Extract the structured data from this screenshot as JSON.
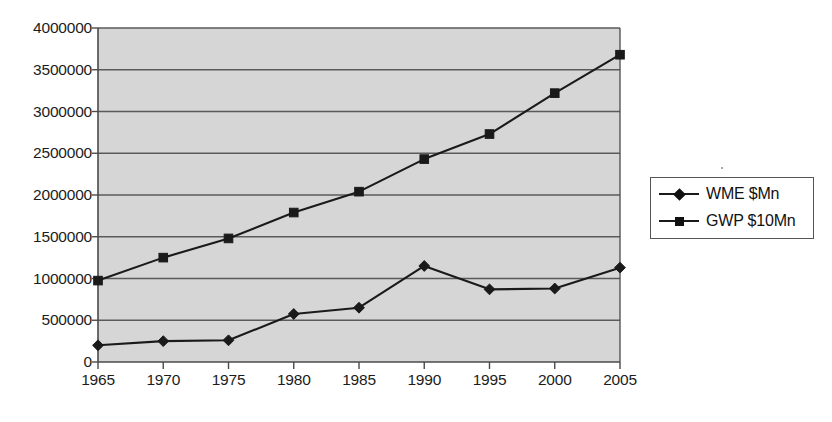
{
  "chart_data": {
    "type": "line",
    "title": "",
    "xlabel": "",
    "ylabel": "",
    "categories": [
      "1965",
      "1970",
      "1975",
      "1980",
      "1985",
      "1990",
      "1995",
      "2000",
      "2005"
    ],
    "x": [
      1965,
      1970,
      1975,
      1980,
      1985,
      1990,
      1995,
      2000,
      2005
    ],
    "series": [
      {
        "name": "WME $Mn",
        "marker": "diamond",
        "color": "#1a1a1a",
        "values": [
          200000,
          250000,
          260000,
          575000,
          650000,
          1150000,
          870000,
          880000,
          1130000
        ]
      },
      {
        "name": "GWP $10Mn",
        "marker": "square",
        "color": "#1a1a1a",
        "values": [
          975000,
          1250000,
          1480000,
          1790000,
          2040000,
          2430000,
          2730000,
          3220000,
          3680000
        ]
      }
    ],
    "ylim": [
      0,
      4000000
    ],
    "ytick_labels": [
      "0",
      "500000",
      "1000000",
      "1500000",
      "2000000",
      "2500000",
      "3000000",
      "3500000",
      "4000000"
    ],
    "yticks": [
      0,
      500000,
      1000000,
      1500000,
      2000000,
      2500000,
      3000000,
      3500000,
      4000000
    ],
    "grid": "horizontal",
    "legend_position": "right",
    "plot_background": "#d6d6d6",
    "page_background": "#ffffff"
  }
}
